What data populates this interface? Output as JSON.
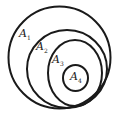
{
  "sets": [
    {
      "name": "A",
      "sub": "1"
    },
    {
      "name": "A",
      "sub": "2"
    },
    {
      "name": "A",
      "sub": "3"
    },
    {
      "name": "A",
      "sub": "4"
    }
  ]
}
